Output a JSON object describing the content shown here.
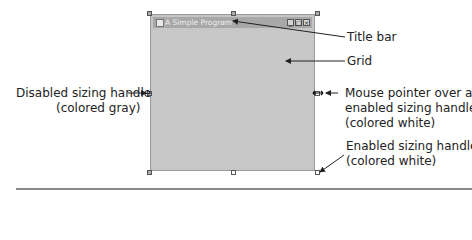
{
  "window": {
    "title": "A Simple Program",
    "controls": {
      "minimize": "_",
      "maximize": "□",
      "close": "×"
    }
  },
  "callouts": {
    "title_bar": "Title bar",
    "grid": "Grid",
    "disabled_handle": {
      "line1": "Disabled sizing handle",
      "line2": "(colored gray)"
    },
    "mouse_pointer": {
      "line1": "Mouse pointer over an",
      "line2": "enabled sizing handle",
      "line3": "(colored white)"
    },
    "enabled_handle": {
      "line1": "Enabled sizing handle",
      "line2": "(colored white)"
    }
  },
  "colors": {
    "handle_enabled": "#ffffff",
    "handle_disabled": "#aaaaaa",
    "form_bg": "#c6c6c6"
  }
}
